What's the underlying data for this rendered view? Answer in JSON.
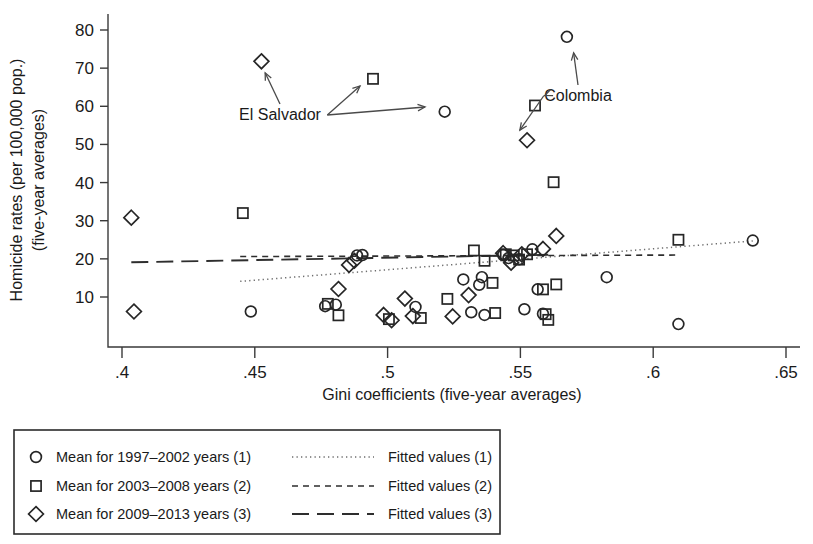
{
  "chart_data": {
    "type": "scatter",
    "title": "",
    "xlabel": "Gini coefficients (five-year averages)",
    "ylabel_line1": "Homicide rates (per 100,000 pop.)",
    "ylabel_line2": "(five-year averages)",
    "xlim": [
      0.4,
      0.65
    ],
    "ylim": [
      0,
      83
    ],
    "xticks": [
      0.4,
      0.45,
      0.5,
      0.55,
      0.6,
      0.65
    ],
    "xticklabels": [
      ".4",
      ".45",
      ".5",
      ".55",
      ".6",
      ".65"
    ],
    "yticks": [
      10,
      20,
      30,
      40,
      50,
      60,
      70,
      80
    ],
    "yticklabels": [
      "10",
      "20",
      "30",
      "40",
      "50",
      "60",
      "70",
      "80"
    ],
    "grid": false,
    "legend_position": "below-left",
    "series": [
      {
        "name": "Mean for 1997-2002 years (1)",
        "marker": "circle",
        "points": [
          [
            0.4485,
            6.2
          ],
          [
            0.4765,
            7.6
          ],
          [
            0.4805,
            8.0
          ],
          [
            0.4885,
            20.9
          ],
          [
            0.4905,
            21.0
          ],
          [
            0.5105,
            7.4
          ],
          [
            0.5215,
            58.6
          ],
          [
            0.5285,
            14.6
          ],
          [
            0.5315,
            6.0
          ],
          [
            0.5345,
            13.2
          ],
          [
            0.5355,
            15.2
          ],
          [
            0.5365,
            5.3
          ],
          [
            0.5435,
            21.0
          ],
          [
            0.5455,
            20.2
          ],
          [
            0.5495,
            19.9
          ],
          [
            0.5515,
            6.8
          ],
          [
            0.5545,
            22.5
          ],
          [
            0.5565,
            12.0
          ],
          [
            0.5585,
            5.6
          ],
          [
            0.5675,
            78.2
          ],
          [
            0.5825,
            15.2
          ],
          [
            0.6095,
            2.9
          ],
          [
            0.6375,
            24.8
          ]
        ]
      },
      {
        "name": "Mean for 2003-2008 years (2)",
        "marker": "square",
        "points": [
          [
            0.4455,
            32.0
          ],
          [
            0.4775,
            8.2
          ],
          [
            0.4815,
            5.2
          ],
          [
            0.4945,
            67.2
          ],
          [
            0.5005,
            4.2
          ],
          [
            0.5125,
            4.5
          ],
          [
            0.5225,
            9.5
          ],
          [
            0.5325,
            22.2
          ],
          [
            0.5365,
            19.5
          ],
          [
            0.5395,
            13.7
          ],
          [
            0.5405,
            5.8
          ],
          [
            0.5445,
            21.2
          ],
          [
            0.5475,
            20.9
          ],
          [
            0.5495,
            19.8
          ],
          [
            0.5525,
            21.2
          ],
          [
            0.5555,
            60.2
          ],
          [
            0.5585,
            12.0
          ],
          [
            0.5595,
            5.5
          ],
          [
            0.5605,
            4.0
          ],
          [
            0.5625,
            40.1
          ],
          [
            0.5635,
            13.3
          ],
          [
            0.6095,
            25.0
          ]
        ]
      },
      {
        "name": "Mean for 2009-2013 years (3)",
        "marker": "diamond",
        "points": [
          [
            0.4035,
            30.8
          ],
          [
            0.4045,
            6.2
          ],
          [
            0.4525,
            71.8
          ],
          [
            0.4815,
            12.1
          ],
          [
            0.4855,
            18.4
          ],
          [
            0.4875,
            19.5
          ],
          [
            0.4985,
            5.3
          ],
          [
            0.5015,
            3.9
          ],
          [
            0.5065,
            9.6
          ],
          [
            0.5095,
            5.0
          ],
          [
            0.5245,
            4.9
          ],
          [
            0.5305,
            10.5
          ],
          [
            0.5435,
            21.5
          ],
          [
            0.5465,
            19.0
          ],
          [
            0.5505,
            21.2
          ],
          [
            0.5525,
            51.1
          ],
          [
            0.5585,
            22.6
          ],
          [
            0.5635,
            26.0
          ]
        ]
      }
    ],
    "fitted_lines": [
      {
        "name": "Fitted values (1)",
        "style": "dotted",
        "x_start": 0.4445,
        "x_end": 0.6375,
        "y_start": 14.1,
        "y_end": 24.7
      },
      {
        "name": "Fitted values (2)",
        "style": "dashed",
        "x_start": 0.4445,
        "x_end": 0.6095,
        "y_start": 20.6,
        "y_end": 21.0
      },
      {
        "name": "Fitted values (3)",
        "style": "long-dash",
        "x_start": 0.4035,
        "x_end": 0.5635,
        "y_start": 19.1,
        "y_end": 21.1
      }
    ],
    "annotations": [
      {
        "label": "El Salvador",
        "label_x": 280,
        "label_y": 120,
        "targets": [
          {
            "x": 260,
            "y": 62
          },
          {
            "x": 369,
            "y": 78
          },
          {
            "x": 437,
            "y": 106
          }
        ]
      },
      {
        "label": "Colombia",
        "label_x": 578,
        "label_y": 101,
        "targets": [
          {
            "x": 572,
            "y": 41
          },
          {
            "x": 534,
            "y": 100
          },
          {
            "x": 513,
            "y": 140
          }
        ]
      }
    ]
  },
  "legend": {
    "marker_entries": [
      {
        "marker": "circle",
        "label": "Mean for 1997–2002 years (1)"
      },
      {
        "marker": "square",
        "label": "Mean for 2003–2008 years (2)"
      },
      {
        "marker": "diamond",
        "label": "Mean for 2009–2013 years (3)"
      }
    ],
    "line_entries": [
      {
        "style": "dotted",
        "label": "Fitted values (1)"
      },
      {
        "style": "dashed",
        "label": "Fitted values (2)"
      },
      {
        "style": "long-dash",
        "label": "Fitted values (3)"
      }
    ]
  }
}
